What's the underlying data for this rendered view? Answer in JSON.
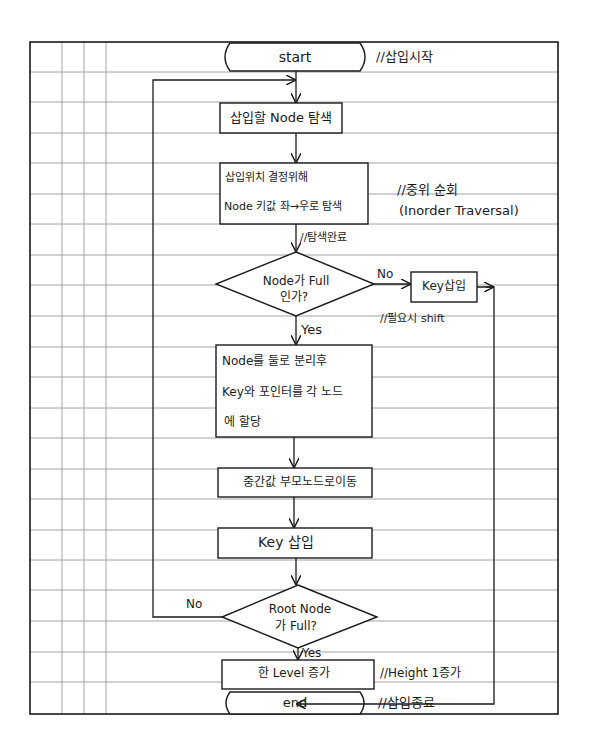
{
  "diagram": {
    "type": "flowchart",
    "colors": {
      "ink": "#1a1a1a",
      "grid": "#9a9a9a",
      "paper": "#ffffff"
    },
    "nodes": {
      "start": {
        "shape": "terminal",
        "label": "start",
        "note": "//삽입시작"
      },
      "search_node": {
        "shape": "process",
        "label": "삽입할 Node 탐색"
      },
      "find_position": {
        "shape": "process",
        "line1": "삽입위치 결정위해",
        "line2": "Node 키값 좌→우로 탐색",
        "note_line1": "//중위 순회",
        "note_line2": "(Inorder Traversal)"
      },
      "search_done_note": "//탐색완료",
      "node_full": {
        "shape": "decision",
        "line1": "Node가 Full",
        "line2": "인가?",
        "no_label": "No",
        "yes_label": "Yes"
      },
      "key_insert_simple": {
        "shape": "process",
        "label": "Key삽입",
        "note": "//필요시 shift"
      },
      "split_node": {
        "shape": "process",
        "line1": "Node를 둘로 분리후",
        "line2": "Key와 포인터를 각 노드",
        "line3": "에 할당"
      },
      "move_middle": {
        "shape": "process",
        "label": "중간값 부모노드로이동"
      },
      "key_insert": {
        "shape": "process",
        "label": "Key 삽입"
      },
      "root_full": {
        "shape": "decision",
        "line1": "Root Node",
        "line2": "가 Full?",
        "no_label": "No",
        "yes_label": "Yes"
      },
      "level_up": {
        "shape": "process",
        "label": "한 Level 증가",
        "note": "//Height 1증가"
      },
      "end": {
        "shape": "terminal",
        "label": "end",
        "note": "//삽입종료"
      }
    },
    "edges": [
      {
        "from": "start",
        "to": "search_node"
      },
      {
        "from": "search_node",
        "to": "find_position"
      },
      {
        "from": "find_position",
        "to": "node_full",
        "label": "//탐색완료"
      },
      {
        "from": "node_full",
        "to": "key_insert_simple",
        "label": "No"
      },
      {
        "from": "node_full",
        "to": "split_node",
        "label": "Yes"
      },
      {
        "from": "split_node",
        "to": "move_middle"
      },
      {
        "from": "move_middle",
        "to": "key_insert"
      },
      {
        "from": "key_insert",
        "to": "root_full"
      },
      {
        "from": "root_full",
        "to": "search_node",
        "label": "No"
      },
      {
        "from": "root_full",
        "to": "level_up",
        "label": "Yes"
      },
      {
        "from": "level_up",
        "to": "end"
      },
      {
        "from": "key_insert_simple",
        "to": "end"
      }
    ]
  }
}
